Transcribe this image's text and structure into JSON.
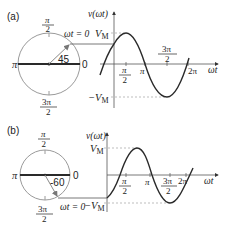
{
  "panels": [
    {
      "id": "a",
      "label": "(a)",
      "phasor": {
        "angle_label": "45",
        "angle_deg": 45,
        "top_label_num": "π",
        "top_label_den": "2",
        "bottom_label_num": "3π",
        "bottom_label_den": "2",
        "left_label": "π",
        "right_label": "0",
        "start_label": "ωt = 0"
      },
      "graph": {
        "y_axis_label": "v(ωt)",
        "x_axis_label": "ωt",
        "vmax_label": "V",
        "vmax_sub": "M",
        "vmin_label": "−V",
        "vmin_sub": "M",
        "ticks": [
          {
            "num": "π",
            "den": "2"
          },
          {
            "label": "π"
          },
          {
            "num": "3π",
            "den": "2"
          },
          {
            "label": "2π"
          }
        ]
      }
    },
    {
      "id": "b",
      "label": "(b)",
      "phasor": {
        "angle_label": "-60",
        "angle_deg": -60,
        "top_label_num": "π",
        "top_label_den": "2",
        "bottom_label_num": "3π",
        "bottom_label_den": "2",
        "left_label": "π",
        "right_label": "0",
        "start_label": "ωt = 0"
      },
      "graph": {
        "y_axis_label": "v(ωt)",
        "x_axis_label": "ωt",
        "vmax_label": "V",
        "vmax_sub": "M",
        "vmin_label": "−V",
        "vmin_sub": "M",
        "ticks": [
          {
            "num": "π",
            "den": "2"
          },
          {
            "label": "π"
          },
          {
            "num": "3π",
            "den": "2"
          },
          {
            "label": "2π"
          }
        ]
      }
    }
  ],
  "colors": {
    "circle": "#9a9a9a",
    "curve": "#2a2a2a",
    "axis": "#555555",
    "dash": "#a0a0a0"
  }
}
